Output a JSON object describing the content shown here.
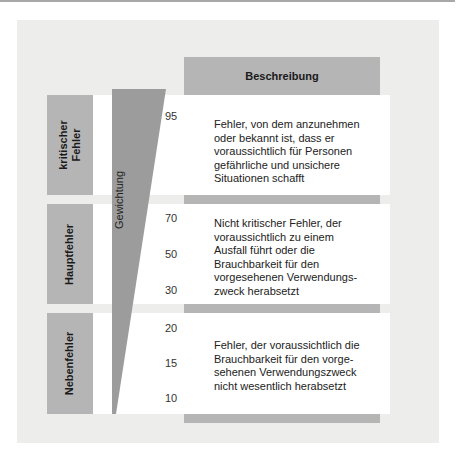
{
  "header": {
    "title": "Beschreibung"
  },
  "axis": {
    "label": "Gewichtung"
  },
  "categories": [
    {
      "label": "kritischer\nFehler",
      "ticks": [
        "95"
      ],
      "description": "Fehler, von dem anzunehmen\noder bekannt ist, dass er\nvoraussichtlich für Personen\ngefährliche und unsichere\nSituationen schafft"
    },
    {
      "label": "Hauptfehler",
      "ticks": [
        "70",
        "50",
        "30"
      ],
      "description": "Nicht kritischer Fehler, der\nvoraussichtlich zu einem\nAusfall führt oder die\nBrauchbarkeit für den\nvorgesehenen Verwendungs-\nzweck herabsetzt"
    },
    {
      "label": "Nebenfehler",
      "ticks": [
        "20",
        "15",
        "10"
      ],
      "description": "Fehler, der voraussichtlich die\nBrauchbarkeit für den vorge-\nsehenen Verwendungszweck\nnicht wesentlich herabsetzt"
    }
  ],
  "colors": {
    "panel": "#ededeb",
    "box": "#b5b5b5",
    "wedge": "#9a9a9a",
    "white": "#ffffff"
  }
}
